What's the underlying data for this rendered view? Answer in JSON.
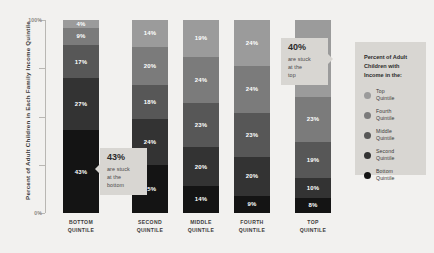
{
  "chart_data": {
    "type": "bar",
    "title": "",
    "xlabel": "",
    "ylabel": "Percent of Adult Children in Each Family Income Quintile",
    "ylim": [
      0,
      100
    ],
    "grid": false,
    "legend_position": "right",
    "legend_title": "Percent of Adult Children with Income in the:",
    "categories": [
      "BOTTOM\nQUINTILE",
      "SECOND\nQUINTILE",
      "MIDDLE\nQUINTILE",
      "FOURTH\nQUINTILE",
      "TOP\nQUINTILE"
    ],
    "series": [
      {
        "name": "Top Quintile",
        "color": "#9b9b9b",
        "values": [
          4,
          14,
          19,
          24,
          40
        ]
      },
      {
        "name": "Fourth Quintile",
        "color": "#7b7b7b",
        "values": [
          9,
          20,
          24,
          24,
          23
        ]
      },
      {
        "name": "Middle Quintile",
        "color": "#575757",
        "values": [
          17,
          18,
          23,
          23,
          19
        ]
      },
      {
        "name": "Second Quintile",
        "color": "#333333",
        "values": [
          27,
          24,
          20,
          20,
          10
        ]
      },
      {
        "name": "Bottom Quintile",
        "color": "#141414",
        "values": [
          43,
          25,
          14,
          9,
          8
        ]
      }
    ],
    "annotations": [
      {
        "value": "43%",
        "text": "are stuck\nat the\nbottom"
      },
      {
        "value": "40%",
        "text": "are stuck\nat the\ntop"
      }
    ]
  },
  "yaxis": {
    "title": "Percent of Adult Children in Each Family Income Quintile",
    "ticks": [
      {
        "label": "100%",
        "value": 100
      },
      {
        "label": "",
        "value": 75
      },
      {
        "label": "",
        "value": 50
      },
      {
        "label": "",
        "value": 25
      },
      {
        "label": "0%",
        "value": 0
      }
    ]
  },
  "xaxis": {
    "labels": [
      {
        "line1": "BOTTOM",
        "line2": "QUINTILE"
      },
      {
        "line1": "SECOND",
        "line2": "QUINTILE"
      },
      {
        "line1": "MIDDLE",
        "line2": "QUINTILE"
      },
      {
        "line1": "FOURTH",
        "line2": "QUINTILE"
      },
      {
        "line1": "TOP",
        "line2": "QUINTILE"
      }
    ]
  },
  "bars": [
    {
      "name": "bottom-quintile",
      "segments": [
        {
          "label": "4%",
          "value": 4,
          "color": "#9b9b9b"
        },
        {
          "label": "9%",
          "value": 9,
          "color": "#7b7b7b"
        },
        {
          "label": "17%",
          "value": 17,
          "color": "#575757"
        },
        {
          "label": "27%",
          "value": 27,
          "color": "#333333"
        },
        {
          "label": "43%",
          "value": 43,
          "color": "#141414"
        }
      ]
    },
    {
      "name": "second-quintile",
      "segments": [
        {
          "label": "14%",
          "value": 14,
          "color": "#9b9b9b"
        },
        {
          "label": "20%",
          "value": 20,
          "color": "#7b7b7b"
        },
        {
          "label": "18%",
          "value": 18,
          "color": "#575757"
        },
        {
          "label": "24%",
          "value": 24,
          "color": "#333333"
        },
        {
          "label": "25%",
          "value": 25,
          "color": "#141414"
        }
      ]
    },
    {
      "name": "middle-quintile",
      "segments": [
        {
          "label": "19%",
          "value": 19,
          "color": "#9b9b9b"
        },
        {
          "label": "24%",
          "value": 24,
          "color": "#7b7b7b"
        },
        {
          "label": "23%",
          "value": 23,
          "color": "#575757"
        },
        {
          "label": "20%",
          "value": 20,
          "color": "#333333"
        },
        {
          "label": "14%",
          "value": 14,
          "color": "#141414"
        }
      ]
    },
    {
      "name": "fourth-quintile",
      "segments": [
        {
          "label": "24%",
          "value": 24,
          "color": "#9b9b9b"
        },
        {
          "label": "24%",
          "value": 24,
          "color": "#7b7b7b"
        },
        {
          "label": "23%",
          "value": 23,
          "color": "#575757"
        },
        {
          "label": "20%",
          "value": 20,
          "color": "#333333"
        },
        {
          "label": "9%",
          "value": 9,
          "color": "#141414"
        }
      ]
    },
    {
      "name": "top-quintile",
      "segments": [
        {
          "label": "40%",
          "value": 40,
          "color": "#9b9b9b"
        },
        {
          "label": "23%",
          "value": 23,
          "color": "#7b7b7b"
        },
        {
          "label": "19%",
          "value": 19,
          "color": "#575757"
        },
        {
          "label": "10%",
          "value": 10,
          "color": "#333333"
        },
        {
          "label": "8%",
          "value": 8,
          "color": "#141414"
        }
      ]
    }
  ],
  "callouts": {
    "bottom": {
      "value": "43%",
      "line1": "are stuck",
      "line2": "at the",
      "line3": "bottom"
    },
    "top": {
      "value": "40%",
      "line1": "are stuck",
      "line2": "at the",
      "line3": "top"
    }
  },
  "legend": {
    "title": "Percent of Adult Children with Income in the:",
    "items": [
      {
        "line1": "Top",
        "line2": "Quintile",
        "color": "#9b9b9b"
      },
      {
        "line1": "Fourth",
        "line2": "Quintile",
        "color": "#7b7b7b"
      },
      {
        "line1": "Middle",
        "line2": "Quintile",
        "color": "#575757"
      },
      {
        "line1": "Second",
        "line2": "Quintile",
        "color": "#333333"
      },
      {
        "line1": "Bottom",
        "line2": "Quintile",
        "color": "#141414"
      }
    ]
  }
}
